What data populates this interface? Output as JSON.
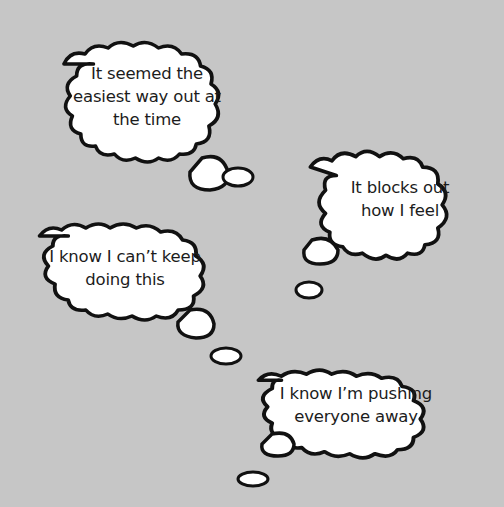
{
  "background_color": "#c6c6c6",
  "bubble_fill": "#ffffff",
  "bubble_stroke": "#111111",
  "thoughts": [
    {
      "lines": [
        "It seemed the",
        "easiest way out at",
        "the time"
      ]
    },
    {
      "lines": [
        "It blocks out",
        "how I feel"
      ]
    },
    {
      "lines": [
        "I know I can’t keep",
        "doing this"
      ]
    },
    {
      "lines": [
        "I know I’m pushing",
        "everyone away"
      ]
    }
  ]
}
